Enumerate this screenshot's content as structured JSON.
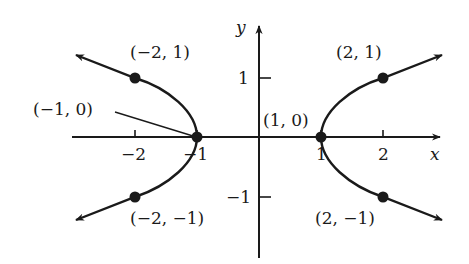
{
  "diagram": {
    "axes": {
      "x_label": "x",
      "y_label": "y",
      "x_ticks": [
        {
          "value": -2,
          "label": "−2"
        },
        {
          "value": -1,
          "label": "−1"
        },
        {
          "value": 1,
          "label": "1"
        },
        {
          "value": 2,
          "label": "2"
        }
      ],
      "y_ticks": [
        {
          "value": 1,
          "label": "1"
        },
        {
          "value": -1,
          "label": "−1"
        }
      ]
    },
    "points": [
      {
        "x": -2,
        "y": 1,
        "label": "(−2, 1)"
      },
      {
        "x": -1,
        "y": 0,
        "label": "(−1, 0)"
      },
      {
        "x": -2,
        "y": -1,
        "label": "(−2, −1)"
      },
      {
        "x": 2,
        "y": 1,
        "label": "(2, 1)"
      },
      {
        "x": 1,
        "y": 0,
        "label": "(1, 0)"
      },
      {
        "x": 2,
        "y": -1,
        "label": "(2, −1)"
      }
    ],
    "colors": {
      "ink": "#1a1a1a",
      "background": "#ffffff"
    }
  }
}
